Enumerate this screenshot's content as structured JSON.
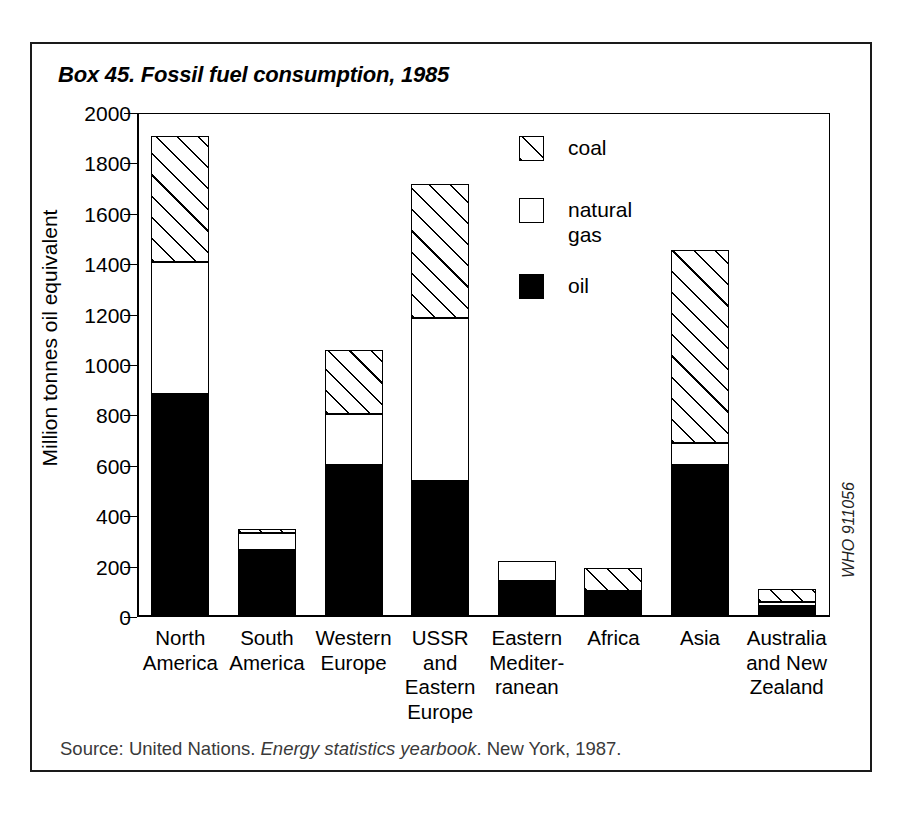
{
  "figure": {
    "title": "Box 45. Fossil fuel consumption, 1985",
    "who_code": "WHO 911056",
    "source_prefix": "Source: United Nations. ",
    "source_italic": "Energy statistics yearbook",
    "source_suffix": ". New York, 1987."
  },
  "legend": {
    "items": [
      {
        "label": "coal",
        "pattern": "hatched",
        "color": "#ffffff"
      },
      {
        "label": "natural\ngas",
        "pattern": "solid",
        "color": "#ffffff"
      },
      {
        "label": "oil",
        "pattern": "solid",
        "color": "#000000"
      }
    ]
  },
  "chart_data": {
    "type": "bar",
    "stacked": true,
    "title": "Box 45. Fossil fuel consumption, 1985",
    "xlabel": "",
    "ylabel": "Million tonnes oil equivalent",
    "ylim": [
      0,
      2000
    ],
    "ytick_step": 200,
    "yticks": [
      0,
      200,
      400,
      600,
      800,
      1000,
      1200,
      1400,
      1600,
      1800,
      2000
    ],
    "ytick_labels": [
      "0",
      "200",
      "400",
      "600",
      "800",
      "1000",
      "1200",
      "1400",
      "1600",
      "1800",
      "2000"
    ],
    "grid": false,
    "legend_position": "upper-center-right",
    "categories": [
      "North\nAmerica",
      "South\nAmerica",
      "Western\nEurope",
      "USSR\nand\nEastern\nEurope",
      "Eastern\nMediter-\nranean",
      "Africa",
      "Asia",
      "Australia\nand New\nZealand"
    ],
    "series": [
      {
        "name": "oil",
        "values": [
          885,
          265,
          605,
          540,
          143,
          95,
          605,
          45
        ]
      },
      {
        "name": "natural gas",
        "values": [
          525,
          70,
          200,
          645,
          80,
          8,
          85,
          15
        ]
      },
      {
        "name": "coal",
        "values": [
          500,
          15,
          255,
          535,
          0,
          90,
          765,
          50
        ]
      }
    ],
    "totals": [
      1910,
      350,
      1060,
      1720,
      223,
      193,
      1455,
      110
    ]
  }
}
